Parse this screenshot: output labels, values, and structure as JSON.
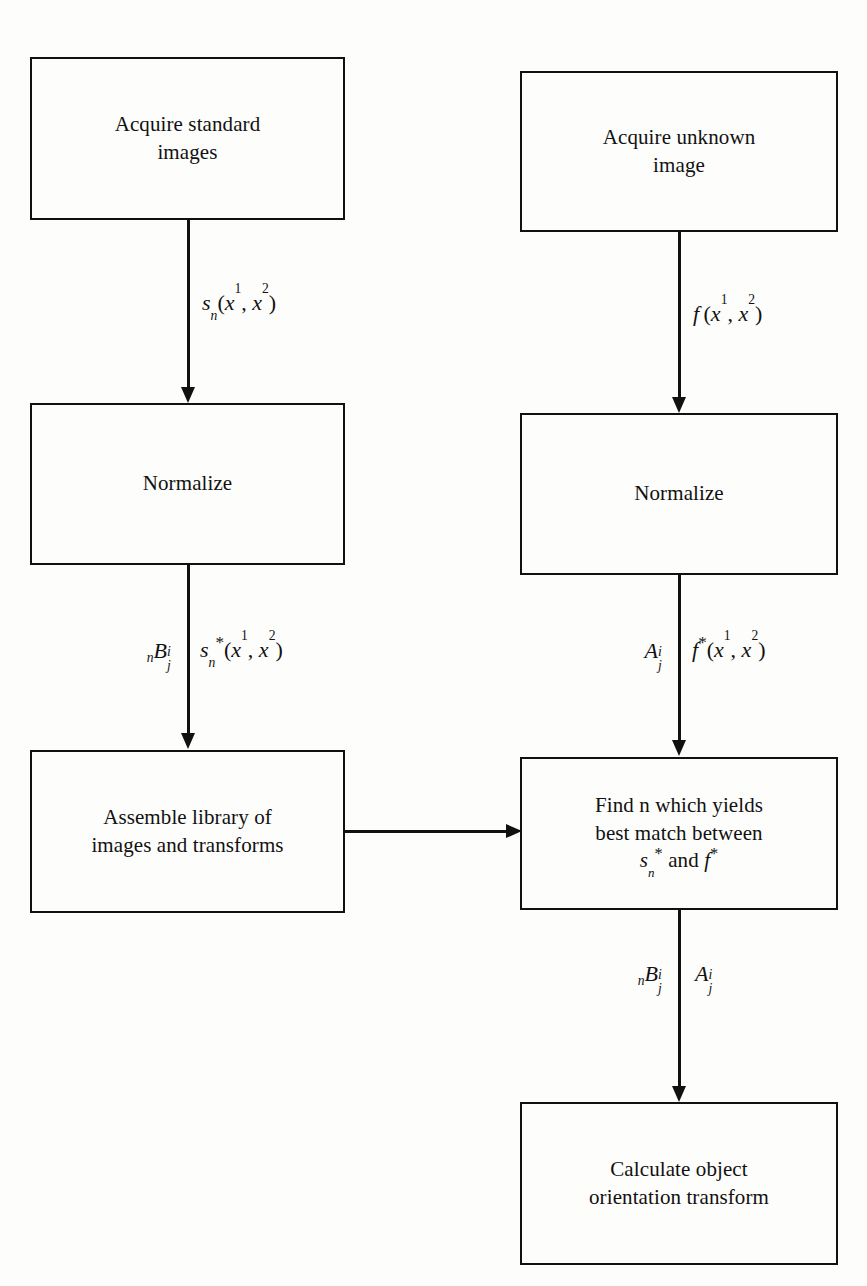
{
  "diagram": {
    "type": "flowchart",
    "background_color": "#fdfdfc",
    "line_color": "#111111"
  },
  "nodes": [
    {
      "id": "acquire-standard-images",
      "text": "Acquire standard\nimages",
      "column": "left",
      "order": 1
    },
    {
      "id": "normalize-left",
      "text": "Normalize",
      "column": "left",
      "order": 2
    },
    {
      "id": "assemble-library",
      "text": "Assemble library of\nimages and transforms",
      "column": "left",
      "order": 3
    },
    {
      "id": "acquire-unknown-image",
      "text": "Acquire unknown\nimage",
      "column": "right",
      "order": 1
    },
    {
      "id": "normalize-right",
      "text": "Normalize",
      "column": "right",
      "order": 2
    },
    {
      "id": "find-best-match",
      "text_line1": "Find n which yields",
      "text_line2": "best match between",
      "text_line3_math": "s*_n and f*",
      "column": "right",
      "order": 3
    },
    {
      "id": "calculate-object-orientation",
      "text": "Calculate object\norientation transform",
      "column": "right",
      "order": 4
    }
  ],
  "edges": [
    {
      "id": "edge-standard-to-normalize",
      "from": "acquire-standard-images",
      "to": "normalize-left",
      "direction": "down",
      "label_right_math": "s_n(x^1, x^2)"
    },
    {
      "id": "edge-unknown-to-normalize",
      "from": "acquire-unknown-image",
      "to": "normalize-right",
      "direction": "down",
      "label_right_math": "f(x^1, x^2)"
    },
    {
      "id": "edge-normalize-to-library",
      "from": "normalize-left",
      "to": "assemble-library",
      "direction": "down",
      "label_left_math": "nB^i_j",
      "label_right_math": "s*_n(x^1, x^2)"
    },
    {
      "id": "edge-normalize-to-find",
      "from": "normalize-right",
      "to": "find-best-match",
      "direction": "down",
      "label_left_math": "A^i_j",
      "label_right_math": "f*(x^1, x^2)"
    },
    {
      "id": "edge-library-to-find",
      "from": "assemble-library",
      "to": "find-best-match",
      "direction": "right",
      "label_left_math": "",
      "label_right_math": ""
    },
    {
      "id": "edge-find-to-calculate",
      "from": "find-best-match",
      "to": "calculate-object-orientation",
      "direction": "down",
      "label_left_math": "nB^i_j",
      "label_right_math": "A^i_j"
    }
  ]
}
